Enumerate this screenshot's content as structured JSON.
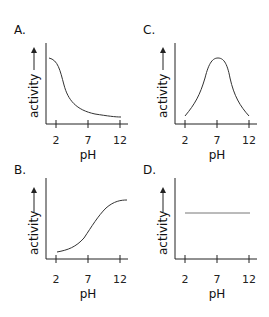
{
  "panels": [
    {
      "id": "A",
      "label": "A.",
      "ylabel": "activity",
      "xlabel": "pH",
      "ticks": [
        "2",
        "7",
        "12"
      ],
      "shape": "decreasing sigmoid"
    },
    {
      "id": "C",
      "label": "C.",
      "ylabel": "activity",
      "xlabel": "pH",
      "ticks": [
        "2",
        "7",
        "12"
      ],
      "shape": "bell curve peaking at pH 7"
    },
    {
      "id": "B",
      "label": "B.",
      "ylabel": "activity",
      "xlabel": "pH",
      "ticks": [
        "2",
        "7",
        "12"
      ],
      "shape": "increasing sigmoid"
    },
    {
      "id": "D",
      "label": "D.",
      "ylabel": "activity",
      "xlabel": "pH",
      "ticks": [
        "2",
        "7",
        "12"
      ],
      "shape": "constant"
    }
  ],
  "colors": {
    "axis": "#222222",
    "curve": "#333333"
  }
}
